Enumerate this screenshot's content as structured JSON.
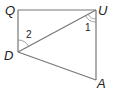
{
  "diagram": {
    "type": "geometry-quadrilateral",
    "vertices": [
      {
        "id": "Q",
        "label": "Q",
        "x": 18,
        "y": 10
      },
      {
        "id": "U",
        "label": "U",
        "x": 96,
        "y": 10
      },
      {
        "id": "D",
        "label": "D",
        "x": 18,
        "y": 52
      },
      {
        "id": "A",
        "label": "A",
        "x": 96,
        "y": 80
      }
    ],
    "edges": [
      [
        "Q",
        "U"
      ],
      [
        "Q",
        "D"
      ],
      [
        "U",
        "A"
      ],
      [
        "D",
        "A"
      ],
      [
        "D",
        "U"
      ]
    ],
    "angles": [
      {
        "label": "1",
        "vertex": "U",
        "between": [
          "D",
          "A"
        ],
        "arcs": 2
      },
      {
        "label": "2",
        "vertex": "D",
        "between": [
          "Q",
          "U"
        ],
        "arcs": 1
      }
    ],
    "colors": {
      "line": "#777777",
      "text": "#222222",
      "background": "#ffffff"
    }
  },
  "labels": {
    "Q": "Q",
    "U": "U",
    "D": "D",
    "A": "A",
    "angle1": "1",
    "angle2": "2"
  }
}
